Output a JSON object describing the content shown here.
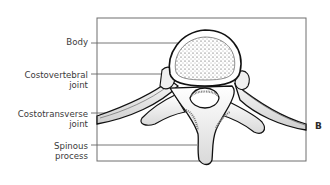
{
  "figure": {
    "panel_letter": "B"
  },
  "labels": [
    {
      "id": "body",
      "lines": [
        "Body"
      ]
    },
    {
      "id": "costovertebral",
      "lines": [
        "Costovertebral",
        "joint"
      ]
    },
    {
      "id": "costotransverse",
      "lines": [
        "Costotransverse",
        "joint"
      ]
    },
    {
      "id": "spinous",
      "lines": [
        "Spinous",
        "process"
      ]
    }
  ],
  "colors": {
    "line": "#555555",
    "outline": "#111111",
    "bone_fill": "#f4f4f4",
    "shade": "#bdbdbd"
  }
}
